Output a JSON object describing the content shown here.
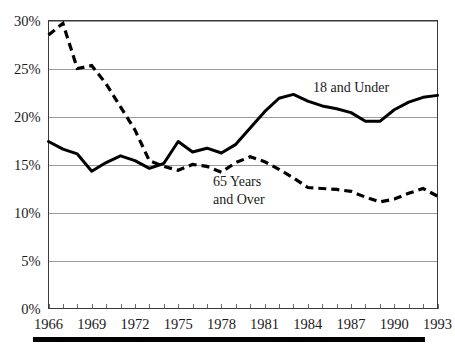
{
  "chart_data": {
    "type": "line",
    "title": "",
    "subtitle": "",
    "xlabel": "",
    "ylabel": "",
    "xlim": [
      1966,
      1993
    ],
    "ylim": [
      0,
      30
    ],
    "grid": true,
    "legend_position": "inline-annotation",
    "x": [
      1966,
      1967,
      1968,
      1969,
      1970,
      1971,
      1972,
      1973,
      1974,
      1975,
      1976,
      1977,
      1978,
      1979,
      1980,
      1981,
      1982,
      1983,
      1984,
      1985,
      1986,
      1987,
      1988,
      1989,
      1990,
      1991,
      1992,
      1993
    ],
    "x_tick_labels": [
      "1966",
      "1969",
      "1972",
      "1975",
      "1978",
      "1981",
      "1984",
      "1987",
      "1990",
      "1993"
    ],
    "x_tick_values": [
      1966,
      1969,
      1972,
      1975,
      1978,
      1981,
      1984,
      1987,
      1990,
      1993
    ],
    "y_tick_labels": [
      "0%",
      "5%",
      "10%",
      "15%",
      "20%",
      "25%",
      "30%"
    ],
    "y_tick_values": [
      0,
      5,
      10,
      15,
      20,
      25,
      30
    ],
    "series": [
      {
        "name": "18 and Under",
        "style": "solid",
        "label_text": "18 and Under",
        "values": [
          17.4,
          16.6,
          16.1,
          14.3,
          15.2,
          15.9,
          15.4,
          14.6,
          15.1,
          17.4,
          16.3,
          16.7,
          16.2,
          17.1,
          18.8,
          20.5,
          21.9,
          22.3,
          21.6,
          21.1,
          20.8,
          20.4,
          19.5,
          19.5,
          20.7,
          21.5,
          22.0,
          22.2
        ]
      },
      {
        "name": "65 Years and Over",
        "style": "dashed",
        "label_text_line1": "65 Years",
        "label_text_line2": "and Over",
        "values": [
          28.5,
          29.7,
          25.0,
          25.3,
          23.4,
          21.0,
          18.6,
          15.4,
          14.8,
          14.4,
          15.0,
          14.8,
          14.2,
          15.2,
          15.8,
          15.3,
          14.5,
          13.6,
          12.6,
          12.5,
          12.4,
          12.2,
          11.6,
          11.1,
          11.4,
          12.0,
          12.5,
          11.7
        ]
      }
    ],
    "colors": {
      "series_line": "#000000",
      "gridline": "#9a9a9a",
      "axis": "#3a3a3a",
      "text": "#1a1a1a",
      "background": "#ffffff",
      "footer_rule": "#000000"
    },
    "annotations": [
      {
        "name": "label-18-and-under",
        "text": "18 and Under",
        "near_x": 1986,
        "near_y": 23.0
      },
      {
        "name": "label-65-years",
        "text": "65 Years",
        "near_x": 1978,
        "near_y": 13.3
      },
      {
        "name": "label-and-over",
        "text": "and Over",
        "near_x": 1978,
        "near_y": 12.2
      }
    ]
  }
}
